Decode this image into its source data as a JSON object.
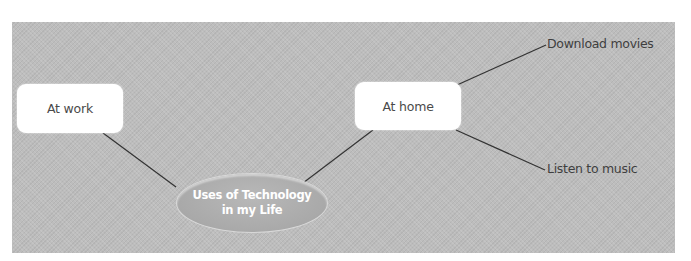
{
  "diagram": {
    "type": "mind-map",
    "central_node": {
      "line1": "Uses of Technology",
      "line2": "in my Life"
    },
    "nodes": [
      {
        "id": "work",
        "label": "At work"
      },
      {
        "id": "home",
        "label": "At home"
      }
    ],
    "leaves": [
      {
        "parent": "home",
        "label": "Download movies"
      },
      {
        "parent": "home",
        "label": "Listen to music"
      }
    ],
    "colors": {
      "background": "#bdbdbd",
      "box_fill": "#ffffff",
      "oval_fill": "#a9a9a9",
      "line": "#333333",
      "text": "#4a4a4a"
    }
  }
}
